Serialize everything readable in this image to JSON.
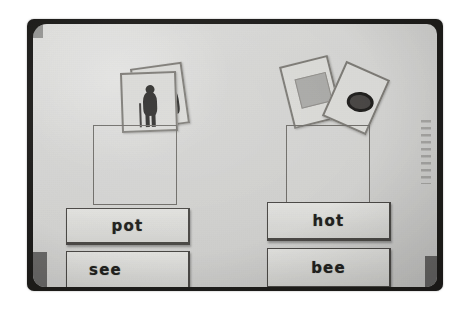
{
  "photo": {
    "type": "black-and-white photograph",
    "subject": "classroom pocket chart with word cards and picture cards",
    "frame_color": "#1d1c1a",
    "board_color": "#d3d3d1",
    "ink_color": "#201f1d"
  },
  "edge_annotation": {
    "text": "illegible handwriting",
    "orientation": "vertical"
  },
  "columns": [
    {
      "id": "left",
      "pocket": {
        "name": "picture-pocket-left",
        "outline_color": "#6e6c68"
      },
      "picture_cards": [
        {
          "id": "left-back",
          "content": "blank card",
          "tilt_deg": -8
        },
        {
          "id": "left-front",
          "content": "silhouette of a standing person",
          "tilt_deg": -2
        }
      ],
      "word_cards": [
        {
          "id": "left-top",
          "word": "pot"
        },
        {
          "id": "left-bottom",
          "word": "see"
        }
      ]
    },
    {
      "id": "right",
      "pocket": {
        "name": "picture-pocket-right",
        "outline_color": "#6e6c68"
      },
      "picture_cards": [
        {
          "id": "right-left",
          "content": "gray square picture",
          "tilt_deg": -14
        },
        {
          "id": "right-right",
          "content": "dark oval ring object",
          "tilt_deg": 24
        }
      ],
      "word_cards": [
        {
          "id": "right-top",
          "word": "hot"
        },
        {
          "id": "right-bottom",
          "word": "bee"
        }
      ]
    }
  ]
}
